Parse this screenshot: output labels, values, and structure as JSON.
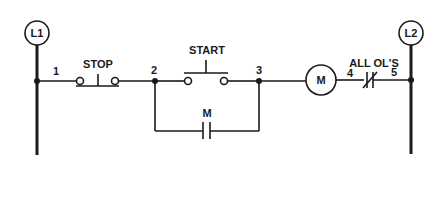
{
  "diagram": {
    "type": "ladder-diagram",
    "rails": {
      "left": {
        "label": "L1"
      },
      "right": {
        "label": "L2"
      }
    },
    "wire_numbers": [
      "1",
      "2",
      "3",
      "4",
      "5"
    ],
    "components": {
      "stop": {
        "label": "STOP",
        "type": "normally-closed pushbutton"
      },
      "start": {
        "label": "START",
        "type": "normally-open pushbutton"
      },
      "seal_in": {
        "label": "M",
        "type": "normally-open auxiliary contact"
      },
      "motor": {
        "label": "M",
        "type": "motor starter coil"
      },
      "overloads": {
        "label": "ALL OL'S",
        "type": "normally-closed overload contacts"
      }
    },
    "colors": {
      "ink": "#1a1a1a",
      "background": "#ffffff"
    }
  }
}
